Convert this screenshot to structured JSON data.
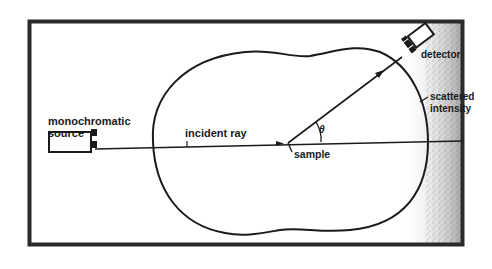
{
  "diagram": {
    "labels": {
      "source_line1": "monochromatic",
      "source_line2": "source",
      "incident_ray": "incident ray",
      "sample": "sample",
      "angle": "θ",
      "detector": "detector",
      "scattered_line1": "scattered",
      "scattered_line2": "intensity"
    },
    "colors": {
      "ink": "#1a1a1a",
      "paper": "#ffffff",
      "frame": "#2a2a2a",
      "noise": "#7a7a7a"
    }
  }
}
